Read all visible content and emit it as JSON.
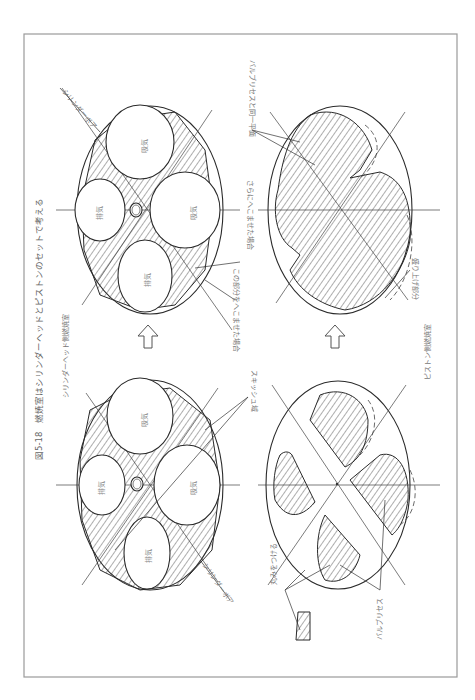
{
  "figure": {
    "title": "図5-18　燃焼室はシリンダーヘッドとピストンのセットで考える",
    "orientation": "rotated 90° counter-clockwise",
    "sections": {
      "head": {
        "caption": "シリンダーヘッド側燃焼室",
        "valves": {
          "intake_1": "吸気",
          "intake_2": "吸気",
          "exhaust_1": "排気",
          "exhaust_2": "排気"
        }
      },
      "piston": {
        "caption": "ピストン側燃焼室"
      }
    },
    "labels": {
      "cylinder_bore_top": "シリンダーボア",
      "cylinder_bore_bottom": "シリンダーボア",
      "squish_area": "スキッシュ域",
      "recess_this_part": "この部分をへこませた場合",
      "recess_further": "さらにへこませた場合",
      "same_plane_as_valve_recess": "バルブリセスと同一平面",
      "raised_part": "盛り上げ部分",
      "rounding": "丸みをつける",
      "valve_recess": "バルブリセス"
    },
    "colors": {
      "line": "#2a2a2a",
      "frame": "#9a9a9a",
      "text": "#777777",
      "background": "#ffffff"
    }
  }
}
